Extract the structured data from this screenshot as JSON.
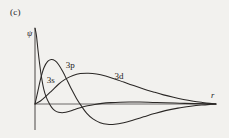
{
  "figure": {
    "panel_label": "(c)",
    "background_color": "#f2f1ee",
    "curve_color": "#2a2725",
    "axis_color": "#4a4745"
  },
  "chart_data": {
    "type": "line",
    "title": "",
    "subtitle": "",
    "xlabel": "r",
    "ylabel": "ψ",
    "xlim": [
      0,
      1
    ],
    "ylim": [
      -0.35,
      1.0
    ],
    "grid": false,
    "legend_position": "inline-annotations",
    "axis_labels": {
      "y_symbol": "ψ",
      "x_symbol": "r"
    },
    "annotations": [
      {
        "text": "3s",
        "x": 0.065,
        "y": 0.28
      },
      {
        "text": "3p",
        "x": 0.17,
        "y": 0.47
      },
      {
        "text": "3d",
        "x": 0.44,
        "y": 0.33
      }
    ],
    "series": [
      {
        "name": "3s",
        "label": "3s",
        "points": [
          [
            0.0,
            1.0
          ],
          [
            0.008,
            0.9
          ],
          [
            0.016,
            0.72
          ],
          [
            0.026,
            0.52
          ],
          [
            0.036,
            0.35
          ],
          [
            0.048,
            0.2
          ],
          [
            0.062,
            0.09
          ],
          [
            0.078,
            0.01
          ],
          [
            0.092,
            -0.04
          ],
          [
            0.11,
            -0.08
          ],
          [
            0.13,
            -0.1
          ],
          [
            0.15,
            -0.105
          ],
          [
            0.17,
            -0.1
          ],
          [
            0.195,
            -0.085
          ],
          [
            0.22,
            -0.065
          ],
          [
            0.25,
            -0.045
          ],
          [
            0.29,
            -0.022
          ],
          [
            0.33,
            -0.005
          ],
          [
            0.37,
            0.008
          ],
          [
            0.42,
            0.018
          ],
          [
            0.47,
            0.024
          ],
          [
            0.52,
            0.026
          ],
          [
            0.58,
            0.025
          ],
          [
            0.65,
            0.021
          ],
          [
            0.72,
            0.016
          ],
          [
            0.8,
            0.01
          ],
          [
            0.88,
            0.005
          ],
          [
            0.95,
            0.002
          ],
          [
            1.0,
            0.0
          ]
        ]
      },
      {
        "name": "3p",
        "label": "3p",
        "points": [
          [
            0.0,
            0.0
          ],
          [
            0.015,
            0.16
          ],
          [
            0.032,
            0.34
          ],
          [
            0.05,
            0.48
          ],
          [
            0.07,
            0.56
          ],
          [
            0.09,
            0.585
          ],
          [
            0.11,
            0.57
          ],
          [
            0.13,
            0.52
          ],
          [
            0.155,
            0.42
          ],
          [
            0.18,
            0.3
          ],
          [
            0.205,
            0.18
          ],
          [
            0.23,
            0.07
          ],
          [
            0.255,
            -0.02
          ],
          [
            0.285,
            -0.11
          ],
          [
            0.32,
            -0.18
          ],
          [
            0.36,
            -0.225
          ],
          [
            0.4,
            -0.245
          ],
          [
            0.44,
            -0.245
          ],
          [
            0.49,
            -0.225
          ],
          [
            0.54,
            -0.195
          ],
          [
            0.6,
            -0.155
          ],
          [
            0.66,
            -0.115
          ],
          [
            0.72,
            -0.08
          ],
          [
            0.79,
            -0.05
          ],
          [
            0.86,
            -0.028
          ],
          [
            0.92,
            -0.013
          ],
          [
            0.97,
            -0.004
          ],
          [
            1.0,
            0.0
          ]
        ]
      },
      {
        "name": "3d",
        "label": "3d",
        "points": [
          [
            0.0,
            0.0
          ],
          [
            0.03,
            0.04
          ],
          [
            0.06,
            0.1
          ],
          [
            0.095,
            0.18
          ],
          [
            0.13,
            0.26
          ],
          [
            0.17,
            0.33
          ],
          [
            0.21,
            0.375
          ],
          [
            0.25,
            0.4
          ],
          [
            0.295,
            0.405
          ],
          [
            0.34,
            0.395
          ],
          [
            0.39,
            0.368
          ],
          [
            0.44,
            0.33
          ],
          [
            0.49,
            0.288
          ],
          [
            0.545,
            0.242
          ],
          [
            0.6,
            0.198
          ],
          [
            0.655,
            0.158
          ],
          [
            0.71,
            0.12
          ],
          [
            0.765,
            0.088
          ],
          [
            0.82,
            0.06
          ],
          [
            0.875,
            0.037
          ],
          [
            0.925,
            0.02
          ],
          [
            0.965,
            0.008
          ],
          [
            1.0,
            0.0
          ]
        ]
      }
    ]
  }
}
